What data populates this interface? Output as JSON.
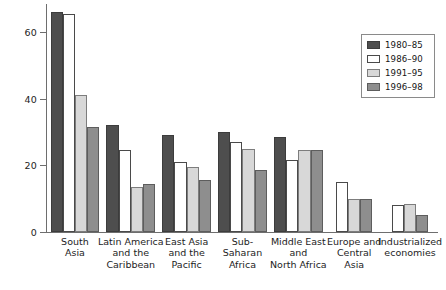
{
  "chart_data": {
    "type": "bar",
    "title": "",
    "subtitle": "",
    "xlabel": "",
    "ylabel": "",
    "ylim": [
      0,
      70
    ],
    "yticks": [
      0,
      20,
      40,
      60
    ],
    "ytick_labels": [
      "0",
      "20",
      "40",
      "60"
    ],
    "grid": false,
    "legend_position": "top-right",
    "categories": [
      "South\nAsia",
      "Latin America\nand the\nCaribbean",
      "East Asia\nand the\nPacific",
      "Sub-\nSaharan\nAfrica",
      "Middle East\nand\nNorth Africa",
      "Europe and\nCentral\nAsia",
      "Industrialized\neconomies"
    ],
    "category_lines": [
      [
        "South",
        "Asia"
      ],
      [
        "Latin America",
        "and the",
        "Caribbean"
      ],
      [
        "East Asia",
        "and the",
        "Pacific"
      ],
      [
        "Sub-",
        "Saharan",
        "Africa"
      ],
      [
        "Middle East",
        "and",
        "North Africa"
      ],
      [
        "Europe and",
        "Central",
        "Asia"
      ],
      [
        "Industrialized",
        "economies"
      ]
    ],
    "series": [
      {
        "name": "1980–85",
        "color": "#4e4e4e",
        "values": [
          66,
          32,
          29,
          30,
          28.5,
          null,
          null
        ]
      },
      {
        "name": "1986–90",
        "color": "#ffffff",
        "values": [
          65.5,
          24.5,
          21,
          27,
          21.5,
          15,
          8
        ]
      },
      {
        "name": "1991–95",
        "color": "#d8d8d8",
        "values": [
          41,
          13.5,
          19.5,
          25,
          24.5,
          10,
          8.5
        ]
      },
      {
        "name": "1996–98",
        "color": "#8e8e8e",
        "values": [
          31.5,
          14.5,
          15.5,
          18.5,
          24.5,
          10,
          5
        ]
      }
    ]
  },
  "legend": {
    "items": [
      {
        "label": "1980–85",
        "swatch": "s0"
      },
      {
        "label": "1986–90",
        "swatch": "s1"
      },
      {
        "label": "1991–95",
        "swatch": "s2"
      },
      {
        "label": "1996–98",
        "swatch": "s3"
      }
    ]
  }
}
